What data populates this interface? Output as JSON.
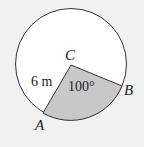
{
  "diagram": {
    "type": "circle-sector",
    "colors": {
      "background": "#f1f1f1",
      "circle_fill": "#ffffff",
      "sector_fill": "#c8c8c8",
      "stroke": "#333333"
    },
    "center_label": "C",
    "point_a_label": "A",
    "point_b_label": "B",
    "radius_label": "6 m",
    "angle_label": "100°"
  }
}
